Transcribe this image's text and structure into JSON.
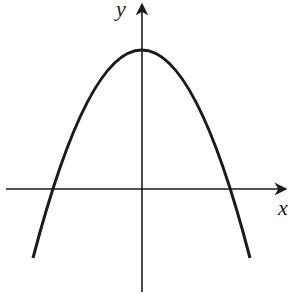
{
  "diagram": {
    "type": "parabola-graph",
    "axes": {
      "x_label": "x",
      "y_label": "y"
    },
    "curve": {
      "shape": "parabola",
      "opens": "down",
      "vertex_on_y_axis": true,
      "x_intercepts": 2
    },
    "colors": {
      "stroke": "#1a1a1a",
      "background": "#ffffff"
    }
  }
}
